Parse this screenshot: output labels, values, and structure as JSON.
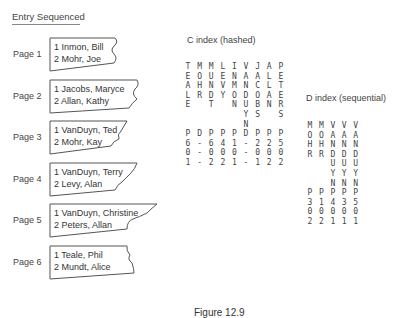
{
  "figure": {
    "section_title": "Entry Sequenced",
    "pages": [
      {
        "label": "Page 1",
        "entries": [
          "1  Inmon, Bill",
          "2  Mohr, Joe"
        ]
      },
      {
        "label": "Page 2",
        "entries": [
          "1  Jacobs, Maryce",
          "2  Allan, Kathy"
        ]
      },
      {
        "label": "Page 3",
        "entries": [
          "1  VanDuyn, Ted",
          "2  Mohr, Kay"
        ]
      },
      {
        "label": "Page 4",
        "entries": [
          "1  VanDuyn, Terry",
          "2  Levy, Alan"
        ]
      },
      {
        "label": "Page 5",
        "entries": [
          "1  VanDuyn, Christine",
          "2  Peters, Allan"
        ]
      },
      {
        "label": "Page 6",
        "entries": [
          "1  Teale, Phil",
          "2  Mundt, Alice"
        ]
      }
    ],
    "c_index": {
      "title": "C index (hashed)",
      "columns": [
        {
          "key": [
            "T",
            "E",
            "A",
            "L",
            "E",
            " ",
            " "
          ],
          "page": "P",
          "ptr": [
            "6",
            "0",
            "1"
          ]
        },
        {
          "key": [
            "M",
            "O",
            "H",
            "R",
            " ",
            " ",
            " "
          ],
          "page": "D",
          "ptr": [
            "-",
            "-",
            "-"
          ]
        },
        {
          "key": [
            "M",
            "U",
            "N",
            "D",
            "T",
            " ",
            " "
          ],
          "page": "P",
          "ptr": [
            "6",
            "0",
            "2"
          ]
        },
        {
          "key": [
            "L",
            "E",
            "V",
            "Y",
            " ",
            " ",
            " "
          ],
          "page": "P",
          "ptr": [
            "4",
            "0",
            "2"
          ]
        },
        {
          "key": [
            "I",
            "N",
            "M",
            "O",
            "N",
            " ",
            " "
          ],
          "page": "P",
          "ptr": [
            "1",
            "0",
            "1"
          ]
        },
        {
          "key": [
            "V",
            "A",
            "N",
            "D",
            "U",
            "Y",
            "N"
          ],
          "page": "D",
          "ptr": [
            "-",
            "-",
            "-"
          ]
        },
        {
          "key": [
            "J",
            "A",
            "C",
            "O",
            "B",
            "S",
            " "
          ],
          "page": "P",
          "ptr": [
            "2",
            "0",
            "1"
          ]
        },
        {
          "key": [
            "A",
            "L",
            "L",
            "A",
            "N",
            " ",
            " "
          ],
          "page": "P",
          "ptr": [
            "2",
            "0",
            "2"
          ]
        },
        {
          "key": [
            "P",
            "E",
            "T",
            "E",
            "R",
            "S",
            " "
          ],
          "page": "P",
          "ptr": [
            "5",
            "0",
            "2"
          ]
        }
      ]
    },
    "d_index": {
      "title": "D index (sequential)",
      "columns": [
        {
          "key": [
            "M",
            "O",
            "H",
            "R",
            " ",
            " ",
            " "
          ],
          "page": "P",
          "ptr": [
            "3",
            "0",
            "2"
          ]
        },
        {
          "key": [
            "M",
            "O",
            "H",
            "R",
            " ",
            " ",
            " "
          ],
          "page": "P",
          "ptr": [
            "1",
            "0",
            "2"
          ]
        },
        {
          "key": [
            "V",
            "A",
            "N",
            "D",
            "U",
            "Y",
            "N"
          ],
          "page": "P",
          "ptr": [
            "4",
            "0",
            "1"
          ]
        },
        {
          "key": [
            "V",
            "A",
            "N",
            "D",
            "U",
            "Y",
            "N"
          ],
          "page": "P",
          "ptr": [
            "3",
            "0",
            "1"
          ]
        },
        {
          "key": [
            "V",
            "A",
            "N",
            "D",
            "U",
            "Y",
            "N"
          ],
          "page": "P",
          "ptr": [
            "5",
            "0",
            "1"
          ]
        }
      ]
    },
    "caption": "Figure 12.9"
  }
}
